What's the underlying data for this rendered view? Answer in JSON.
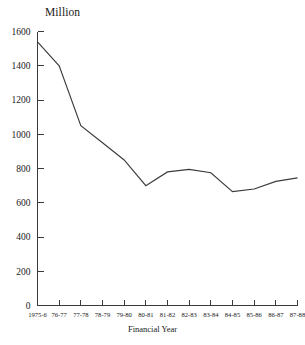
{
  "chart_data": {
    "type": "line",
    "title": "",
    "subtitle": "",
    "xlabel": "Financial Year",
    "ylabel": "Million",
    "ylim": [
      0,
      1600
    ],
    "y_ticks": [
      0,
      200,
      400,
      600,
      800,
      1000,
      1200,
      1400,
      1600
    ],
    "grid": false,
    "legend": "none",
    "categories": [
      "1975-6",
      "76-77",
      "77-78",
      "78-79",
      "79-80",
      "80-81",
      "81-82",
      "82-83",
      "83-84",
      "84-85",
      "85-86",
      "86-87",
      "87-88"
    ],
    "values": [
      1540,
      1400,
      1050,
      950,
      850,
      700,
      780,
      795,
      775,
      665,
      680,
      725,
      745
    ],
    "series": [
      {
        "name": "Million",
        "values": [
          1540,
          1400,
          1050,
          950,
          850,
          700,
          780,
          795,
          775,
          665,
          680,
          725,
          745
        ]
      }
    ],
    "line_color": "#3c3c3c",
    "axis_color": "#3a3a3a",
    "background_color": "#ffffff"
  },
  "axes": {
    "y_unit_label": "Million",
    "x_axis_title": "Financial Year"
  }
}
